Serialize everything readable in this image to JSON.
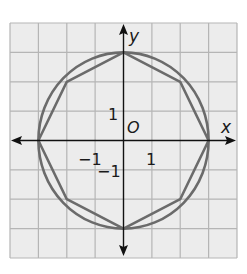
{
  "diagram": {
    "type": "coordinate-plane",
    "grid": {
      "x_range": [
        -4,
        4
      ],
      "y_range": [
        -4,
        4
      ],
      "unit": 1
    },
    "axes": {
      "x_label": "x",
      "y_label": "y",
      "origin_label": "O"
    },
    "tick_labels": {
      "x_pos": "1",
      "x_neg": "−1",
      "y_pos": "1",
      "y_neg": "−1"
    },
    "shapes": [
      {
        "name": "circle",
        "center": [
          0,
          0
        ],
        "radius": 3
      },
      {
        "name": "octagon",
        "vertices": [
          [
            0,
            3
          ],
          [
            2,
            2
          ],
          [
            3,
            0
          ],
          [
            2,
            -2
          ],
          [
            0,
            -3
          ],
          [
            -2,
            -2
          ],
          [
            -3,
            0
          ],
          [
            -2,
            2
          ]
        ]
      }
    ],
    "colors": {
      "grid_fill": "#ececec",
      "grid_line": "#b5b5b5",
      "axis": "#111111",
      "shape_stroke": "#6b6b6b"
    }
  }
}
